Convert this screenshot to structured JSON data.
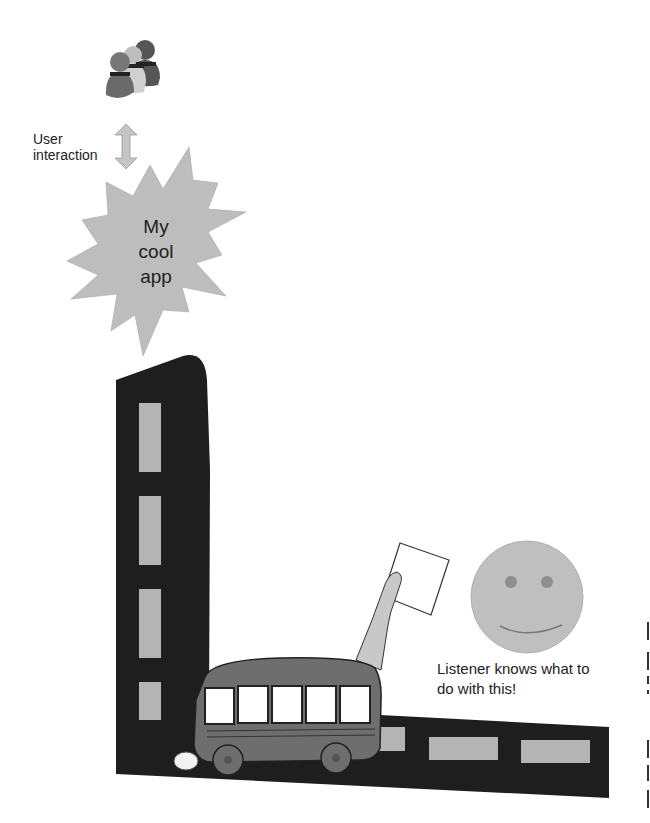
{
  "diagram": {
    "users": {
      "icon": "users-group-icon"
    },
    "interaction": {
      "label_line1": "User",
      "label_line2": "interaction",
      "icon": "double-arrow-icon"
    },
    "app": {
      "line1": "My",
      "line2": "cool",
      "line3": "app",
      "icon": "starburst-icon"
    },
    "road": {
      "vertical_dashes": 4,
      "horizontal_dashes": 3
    },
    "bus": {
      "icon": "bus-icon"
    },
    "hand": {
      "icon": "hand-holding-paper-icon"
    },
    "listener": {
      "icon": "smiley-face-icon",
      "line1": "Listener knows what to",
      "line2": "do with this!"
    },
    "colors": {
      "road": "#1e1e1e",
      "dash": "#b4b4b4",
      "star": "#bdbdbd",
      "smiley": "#bfbfbf",
      "bus": "#6e6e6e",
      "arrow": "#c4c4c4"
    }
  }
}
